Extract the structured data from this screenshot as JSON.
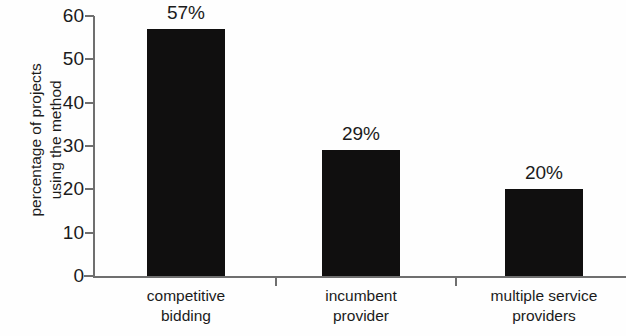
{
  "chart_data": {
    "type": "bar",
    "title": "",
    "xlabel": "",
    "ylabel": "percentage of projects using the method",
    "categories": [
      "competitive bidding",
      "incumbent provider",
      "multiple service providers"
    ],
    "values": [
      57,
      29,
      20
    ],
    "data_labels": [
      "57%",
      "29%",
      "20%"
    ],
    "ylim": [
      0,
      60
    ],
    "yticks": [
      0,
      10,
      20,
      30,
      40,
      50,
      60
    ],
    "ytick_labels": [
      "0",
      "10",
      "20",
      "30",
      "40",
      "50",
      "60"
    ],
    "grid": false,
    "legend": false,
    "bar_color": "#100f0f",
    "axis_color": "#6f6f6f",
    "background_color": "#fefefe"
  },
  "axes": {
    "ylabel_line1": "percentage of projects",
    "ylabel_line2": "using the method"
  },
  "categories_wrapped": [
    {
      "line1": "competitive",
      "line2": "bidding"
    },
    {
      "line1": "incumbent",
      "line2": "provider"
    },
    {
      "line1": "multiple service",
      "line2": "providers"
    }
  ]
}
